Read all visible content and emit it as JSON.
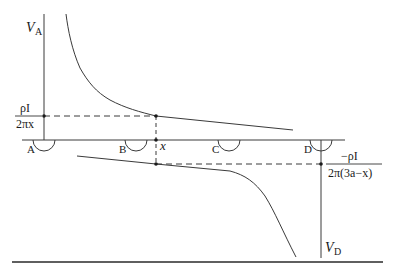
{
  "diagram": {
    "type": "potential-profile",
    "labels": {
      "va_main": "V",
      "va_sub": "A",
      "vd_main": "V",
      "vd_sub": "D",
      "electrode_a": "A",
      "electrode_b": "B",
      "electrode_c": "C",
      "electrode_d": "D",
      "position_x": "x",
      "upper_value_num": "ρI",
      "upper_value_den": "2πx",
      "lower_value_num": "−ρI",
      "lower_value_den": "2π(3a−x)"
    },
    "colors": {
      "line": "#3a3a3a",
      "text": "#1a1a1a",
      "rule": "#2a2a2a"
    }
  }
}
